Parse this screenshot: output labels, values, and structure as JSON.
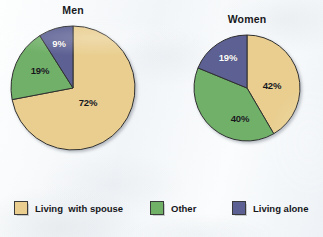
{
  "chart_data": {
    "type": "pie",
    "title": "",
    "charts": [
      {
        "title": "Men",
        "center_x": 73,
        "center_y": 88,
        "radius": 62,
        "labels": [
          "Living with spouse",
          "Other",
          "Living alone"
        ],
        "values": [
          72,
          19,
          9
        ],
        "value_labels": [
          "72%",
          "19%",
          "9%"
        ],
        "label_text_colors": [
          "dark",
          "dark",
          "light"
        ],
        "label_positions": [
          {
            "x": 88,
            "y": 102
          },
          {
            "x": 40,
            "y": 70
          },
          {
            "x": 59,
            "y": 43
          }
        ]
      },
      {
        "title": "Women",
        "center_x": 247,
        "center_y": 88,
        "radius": 53,
        "labels": [
          "Living with spouse",
          "Other",
          "Living alone"
        ],
        "values": [
          42,
          40,
          19
        ],
        "value_labels": [
          "42%",
          "40%",
          "19%"
        ],
        "label_text_colors": [
          "dark",
          "dark",
          "light"
        ],
        "label_positions": [
          {
            "x": 272,
            "y": 85
          },
          {
            "x": 240,
            "y": 118
          },
          {
            "x": 228,
            "y": 57
          }
        ]
      }
    ],
    "legend": {
      "position": "bottom",
      "entries": [
        {
          "label": "Living  with spouse",
          "color": "#e9ce8f",
          "x": 14
        },
        {
          "label": "Other",
          "color": "#70b067",
          "x": 150
        },
        {
          "label": "Living alone",
          "color": "#5c6093",
          "x": 232
        }
      ]
    },
    "colors": {
      "living_with_spouse": "#e9ce8f",
      "other": "#70b067",
      "living_alone": "#5c6093",
      "slice_outline": "#2f2f2f",
      "background": "#f6f8fa",
      "title_text": "#17181c"
    },
    "grid": false,
    "xlabel": "",
    "ylabel": ""
  }
}
